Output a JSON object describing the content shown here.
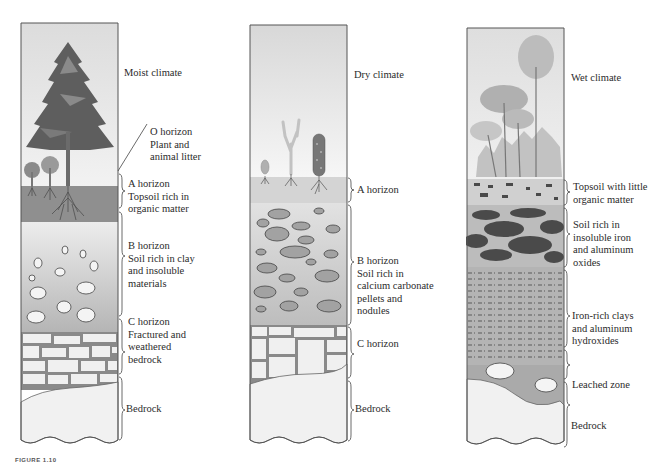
{
  "figure": {
    "caption": "FIGURE 1.10"
  },
  "profiles": [
    {
      "climate": "Moist climate",
      "horizons": [
        {
          "name": "O horizon",
          "lines": [
            "O horizon",
            "Plant and",
            "animal litter"
          ]
        },
        {
          "name": "A horizon",
          "lines": [
            "A horizon",
            "Topsoil rich in",
            "organic matter"
          ]
        },
        {
          "name": "B horizon",
          "lines": [
            "B horizon",
            "Soil rich in clay",
            "and insoluble",
            "materials"
          ]
        },
        {
          "name": "C horizon",
          "lines": [
            "C horizon",
            "Fractured and",
            "weathered",
            "bedrock"
          ]
        },
        {
          "name": "Bedrock",
          "lines": [
            "Bedrock"
          ]
        }
      ]
    },
    {
      "climate": "Dry climate",
      "horizons": [
        {
          "name": "A horizon",
          "lines": [
            "A horizon"
          ]
        },
        {
          "name": "B horizon",
          "lines": [
            "B horizon",
            "Soil rich in",
            "calcium carbonate",
            "pellets and",
            "nodules"
          ]
        },
        {
          "name": "C horizon",
          "lines": [
            "C horizon"
          ]
        },
        {
          "name": "Bedrock",
          "lines": [
            "Bedrock"
          ]
        }
      ]
    },
    {
      "climate": "Wet climate",
      "horizons": [
        {
          "name": "Topsoil",
          "lines": [
            "Topsoil with little",
            "organic matter"
          ]
        },
        {
          "name": "Oxide layer",
          "lines": [
            "Soil rich in",
            "insoluble iron",
            "and aluminum",
            "oxides"
          ]
        },
        {
          "name": "Clay layer",
          "lines": [
            "Iron-rich clays",
            "and aluminum",
            "hydroxides"
          ]
        },
        {
          "name": "Leached zone",
          "lines": [
            "Leached zone"
          ]
        },
        {
          "name": "Bedrock",
          "lines": [
            "Bedrock"
          ]
        }
      ]
    }
  ],
  "colors": {
    "sky": "#e6e6e6",
    "topsoil_dark": "#8f8f8f",
    "b_layer": "#c4c4c4",
    "rock_light": "#f0f0f0",
    "crack": "#8a8a8a",
    "oxide_dark": "#4a4a4a",
    "outline": "#555555"
  }
}
